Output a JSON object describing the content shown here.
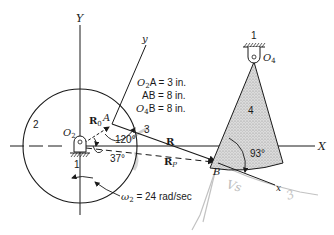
{
  "labels": {
    "Y_axis": "Y",
    "X_axis": "X",
    "y_axis": "y",
    "x_axis": "x",
    "link2": "2",
    "link3": "3",
    "link4": "4",
    "ground_O2": "1",
    "ground_O4": "1",
    "O2": "O",
    "O2_sub": "2",
    "O4": "O",
    "O4_sub": "4",
    "A": "A",
    "B": "B",
    "R0": "R",
    "R0_sub": "0",
    "R": "R",
    "RP": "R",
    "RP_sub": "P",
    "angle_120": "120°",
    "angle_37": "37°",
    "angle_93": "93°"
  },
  "dimensions": [
    {
      "name": "O",
      "sub": "2",
      "rest": "A = 3 in."
    },
    {
      "name": "",
      "sub": "",
      "rest": "AB = 8 in."
    },
    {
      "name": "O",
      "sub": "4",
      "rest": "B = 8 in."
    }
  ],
  "omega": {
    "symbol": "ω",
    "sub": "2",
    "text": " = 24 rad/sec"
  },
  "handwritten": {
    "vs": "Vs",
    "note": "3"
  },
  "colors": {
    "line": "#1a1a1a",
    "shade": "#d4d4d4",
    "pencil": "#b8b8b8"
  }
}
